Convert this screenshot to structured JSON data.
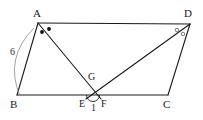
{
  "figure": {
    "stroke_color": "#1a1a1a",
    "mark_fill_color": "#111111",
    "mark_open_color": "#6f6f6f",
    "brace_color": "#8a8a8a",
    "background": "#ffffff",
    "vertices": [
      {
        "id": "A",
        "label": "A",
        "x": 38,
        "y": 23,
        "label_x": 33,
        "label_y": 8
      },
      {
        "id": "B",
        "label": "B",
        "x": 17,
        "y": 95,
        "label_x": 10,
        "label_y": 99
      },
      {
        "id": "C",
        "label": "C",
        "x": 168,
        "y": 95,
        "label_x": 163,
        "label_y": 99
      },
      {
        "id": "D",
        "label": "D",
        "x": 190,
        "y": 24,
        "label_x": 184,
        "label_y": 8
      },
      {
        "id": "E",
        "label": "E",
        "x": 86,
        "y": 95,
        "label_x": 80,
        "label_y": 99
      },
      {
        "id": "F",
        "label": "F",
        "x": 101,
        "y": 95,
        "label_x": 101,
        "label_y": 99
      },
      {
        "id": "G",
        "label": "G",
        "x": 93,
        "y": 86,
        "label_x": 88,
        "label_y": 72
      }
    ],
    "edges": [
      {
        "name": "side-AD",
        "from": "A",
        "to": "D"
      },
      {
        "name": "side-AB",
        "from": "A",
        "to": "B"
      },
      {
        "name": "side-BC",
        "from": "B",
        "to": "C"
      },
      {
        "name": "side-DC",
        "from": "D",
        "to": "C"
      },
      {
        "name": "cevian-AF",
        "from": "A",
        "to": "F"
      },
      {
        "name": "cevian-DE",
        "from": "D",
        "to": "E"
      }
    ],
    "angle_marks": {
      "at_A": {
        "style": "filled-dot",
        "count": 2,
        "points": [
          {
            "x": 42,
            "y": 32
          },
          {
            "x": 49,
            "y": 29
          }
        ],
        "r": 1.9
      },
      "at_D": {
        "style": "open-circle",
        "count": 2,
        "points": [
          {
            "x": 177,
            "y": 30
          },
          {
            "x": 183,
            "y": 34
          }
        ],
        "r": 1.8
      }
    },
    "measures": [
      {
        "name": "side-AB-length",
        "value": "6",
        "label_x": 10,
        "label_y": 47,
        "brace": {
          "from_x": 34,
          "from_y": 28,
          "to_x": 20,
          "to_y": 96,
          "ctrl_x": 4,
          "ctrl_y": 58
        }
      },
      {
        "name": "angle-1",
        "value": "1",
        "label_x": 91,
        "label_y": 104,
        "arc": {
          "cx": 93,
          "cy": 95,
          "r": 6.5
        }
      }
    ]
  }
}
